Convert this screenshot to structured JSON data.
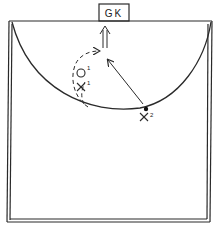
{
  "diagram": {
    "goal_label": "GK",
    "players": [
      {
        "id": "o1",
        "symbol": "O",
        "superscript": "1",
        "team": "offense"
      },
      {
        "id": "x1",
        "symbol": "X",
        "superscript": "1",
        "team": "defense"
      },
      {
        "id": "x2",
        "symbol": "X",
        "superscript": "2",
        "team": "defense"
      }
    ],
    "ball": {
      "holder": "x2"
    },
    "paths": [
      {
        "id": "o1-cut",
        "style": "dashed",
        "description": "curved run from arc up toward goal"
      },
      {
        "id": "pass",
        "style": "solid",
        "description": "pass from X2 toward goal area"
      },
      {
        "id": "shot",
        "style": "double",
        "description": "double arrow toward GK"
      }
    ],
    "colors": {
      "line": "#2a2a2a",
      "background": "#ffffff"
    }
  }
}
